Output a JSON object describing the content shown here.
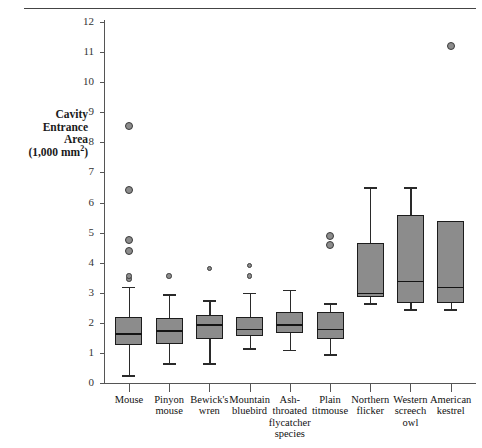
{
  "chart_data": {
    "type": "box",
    "title": "",
    "xlabel": "species",
    "ylabel": "Cavity Entrance Area (1,000 mm2)",
    "ylabel_lines": [
      "Cavity",
      "Entrance",
      "Area",
      "(1,000 mm"
    ],
    "ylabel_super": "2",
    "ylabel_tail": ")",
    "ylim": [
      0,
      12
    ],
    "ytick_labels": [
      "12",
      "11",
      "10",
      "9",
      "8",
      "7",
      "6",
      "5",
      "4",
      "3",
      "2",
      "1",
      "0"
    ],
    "ytick_values": [
      12,
      11,
      10,
      9,
      8,
      7,
      6,
      5,
      4,
      3,
      2,
      1,
      0
    ],
    "grid": false,
    "legend": "none",
    "categories": [
      "Mouse",
      "Pinyon mouse",
      "Bewick's wren",
      "Mountain bluebird",
      "Ash-throated flycatcher",
      "Plain titmouse",
      "Northern flicker",
      "Western screech owl",
      "American kestrel"
    ],
    "category_label_lines": [
      [
        "Mouse"
      ],
      [
        "Pinyon",
        "mouse"
      ],
      [
        "Bewick's",
        "wren"
      ],
      [
        "Mountain",
        "bluebird"
      ],
      [
        "Ash-",
        "throated",
        "flycatcher"
      ],
      [
        "Plain",
        "titmouse"
      ],
      [
        "Northern",
        "flicker"
      ],
      [
        "Western",
        "screech",
        "owl"
      ],
      [
        "American",
        "kestrel"
      ]
    ],
    "axis_suffix_label": "species",
    "boxes": [
      {
        "category": "Mouse",
        "whisker_low": 0.25,
        "q1": 1.25,
        "median": 1.65,
        "q3": 2.2,
        "whisker_high": 3.2,
        "outliers": [
          3.45,
          3.55,
          4.4,
          4.75,
          6.4,
          8.55
        ]
      },
      {
        "category": "Pinyon mouse",
        "whisker_low": 0.65,
        "q1": 1.3,
        "median": 1.75,
        "q3": 2.15,
        "whisker_high": 2.95,
        "outliers": [
          3.55
        ]
      },
      {
        "category": "Bewick's wren",
        "whisker_low": 0.65,
        "q1": 1.45,
        "median": 1.95,
        "q3": 2.25,
        "whisker_high": 2.75,
        "outliers": [
          3.8
        ]
      },
      {
        "category": "Mountain bluebird",
        "whisker_low": 1.15,
        "q1": 1.55,
        "median": 1.8,
        "q3": 2.2,
        "whisker_high": 3.0,
        "outliers": [
          3.55,
          3.9
        ]
      },
      {
        "category": "Ash-throated flycatcher",
        "whisker_low": 1.1,
        "q1": 1.65,
        "median": 1.95,
        "q3": 2.35,
        "whisker_high": 3.1,
        "outliers": []
      },
      {
        "category": "Plain titmouse",
        "whisker_low": 0.95,
        "q1": 1.45,
        "median": 1.8,
        "q3": 2.35,
        "whisker_high": 2.65,
        "outliers": [
          4.6,
          4.9
        ]
      },
      {
        "category": "Northern flicker",
        "whisker_low": 2.65,
        "q1": 2.85,
        "median": 3.0,
        "q3": 4.65,
        "whisker_high": 6.5,
        "outliers": []
      },
      {
        "category": "Western screech owl",
        "whisker_low": 2.45,
        "q1": 2.65,
        "median": 3.4,
        "q3": 5.6,
        "whisker_high": 6.5,
        "outliers": []
      },
      {
        "category": "American kestrel",
        "whisker_low": 2.45,
        "q1": 2.65,
        "median": 3.2,
        "q3": 5.4,
        "whisker_high": 5.4,
        "outliers": [
          11.2
        ]
      }
    ],
    "colors": {
      "box_fill": "#8c8c8c",
      "box_edge": "#1c1c1c",
      "axis": "#555555",
      "outlier_fill": "#8c8c8c",
      "outlier_edge": "#3a3a3a"
    }
  }
}
